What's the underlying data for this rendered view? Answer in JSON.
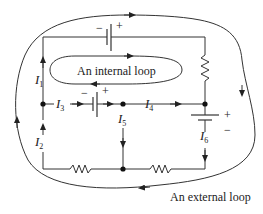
{
  "diagram": {
    "loops": {
      "internal": "An internal loop",
      "external": "An external loop"
    },
    "currents": {
      "I1": {
        "letter": "I",
        "sub": "1"
      },
      "I2": {
        "letter": "I",
        "sub": "2"
      },
      "I3": {
        "letter": "I",
        "sub": "3"
      },
      "I4": {
        "letter": "I",
        "sub": "4"
      },
      "I5": {
        "letter": "I",
        "sub": "5"
      },
      "I6": {
        "letter": "I",
        "sub": "6"
      }
    },
    "polarity": {
      "minus": "−",
      "plus": "+"
    },
    "colors": {
      "line": "#333333",
      "text": "#222222"
    }
  }
}
